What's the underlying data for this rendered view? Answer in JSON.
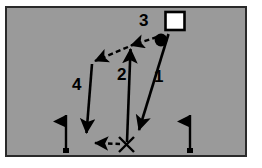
{
  "diagram": {
    "field": {
      "background_color": "#9a9a9a",
      "border_color": "#2a2a2a",
      "page_background": "#ffffff"
    },
    "labels": [
      {
        "id": "step-1",
        "text": "1"
      },
      {
        "id": "step-2",
        "text": "2"
      },
      {
        "id": "step-3",
        "text": "3"
      },
      {
        "id": "step-4",
        "text": "4"
      }
    ],
    "markers": [
      {
        "id": "square-marker",
        "shape": "square-outline",
        "fill": "#ffffff",
        "stroke": "#000000"
      },
      {
        "id": "ball-marker",
        "shape": "filled-circle",
        "fill": "#000000"
      },
      {
        "id": "x-marker",
        "shape": "x-cross",
        "stroke": "#000000"
      },
      {
        "id": "flag-left",
        "shape": "flag-pennant",
        "fill": "#000000",
        "direction": "left"
      },
      {
        "id": "flag-right",
        "shape": "flag-pennant",
        "fill": "#000000",
        "direction": "left"
      }
    ],
    "paths": [
      {
        "id": "path-1",
        "style": "solid",
        "label": "1",
        "from": "square-marker",
        "to": "x-marker"
      },
      {
        "id": "path-2",
        "style": "solid",
        "label": "2",
        "from": "x-marker",
        "to": "upper-middle"
      },
      {
        "id": "path-3",
        "style": "dashed",
        "label": "3",
        "from": "ball-marker",
        "to": "upper-left"
      },
      {
        "id": "path-4",
        "style": "solid",
        "label": "4",
        "from": "upper-left",
        "to": "lower-left"
      },
      {
        "id": "path-5",
        "style": "dashed",
        "label": "",
        "from": "x-marker",
        "to": "lower-left"
      }
    ]
  }
}
